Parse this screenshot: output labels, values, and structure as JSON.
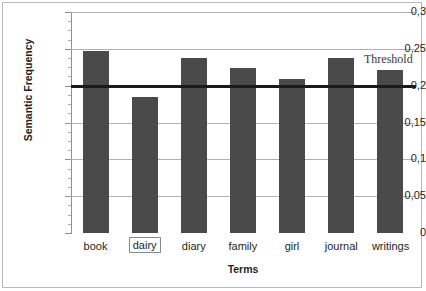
{
  "chart_data": {
    "type": "bar",
    "title": "",
    "subtitle": "",
    "xlabel": "Terms",
    "ylabel": "Semantic Frequency",
    "categories": [
      "book",
      "dairy",
      "diary",
      "family",
      "girl",
      "journal",
      "writings"
    ],
    "values": [
      0.247,
      0.185,
      0.238,
      0.224,
      0.209,
      0.238,
      0.221
    ],
    "ylim": [
      0,
      0.3
    ],
    "ytick_values": [
      0,
      0.05,
      0.1,
      0.15,
      0.2,
      0.25,
      0.3
    ],
    "ytick_labels": [
      "0",
      "0,05",
      "0,1",
      "0,15",
      "0,2",
      "0,25",
      "0,3"
    ],
    "grid": true,
    "legend": false,
    "bar_color": "#4a4a4a",
    "gridline_color": "#b0b0b0",
    "annotations": [
      {
        "name": "threshold",
        "label": "Threshold",
        "value": 0.2,
        "orientation": "horizontal",
        "color": "#1a1a1a"
      }
    ],
    "highlighted_category": "dairy"
  },
  "axes": {
    "y_title": "Semantic Frequency",
    "x_title": "Terms"
  },
  "threshold": {
    "label": "Threshold"
  }
}
